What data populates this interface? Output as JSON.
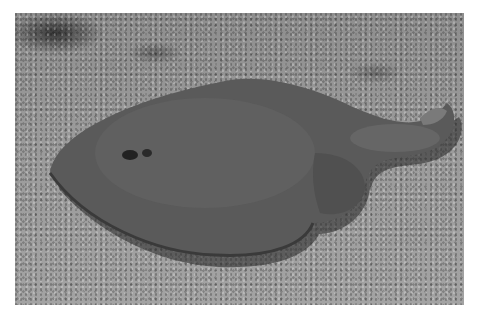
{
  "image": {
    "subject": "ray on sandy seabed",
    "style": "grayscale photograph",
    "colors": {
      "sand": "#9a9a9a",
      "ray_body": "#555555",
      "ray_shadow": "#2e2e2e",
      "border": "#ffffff"
    }
  }
}
